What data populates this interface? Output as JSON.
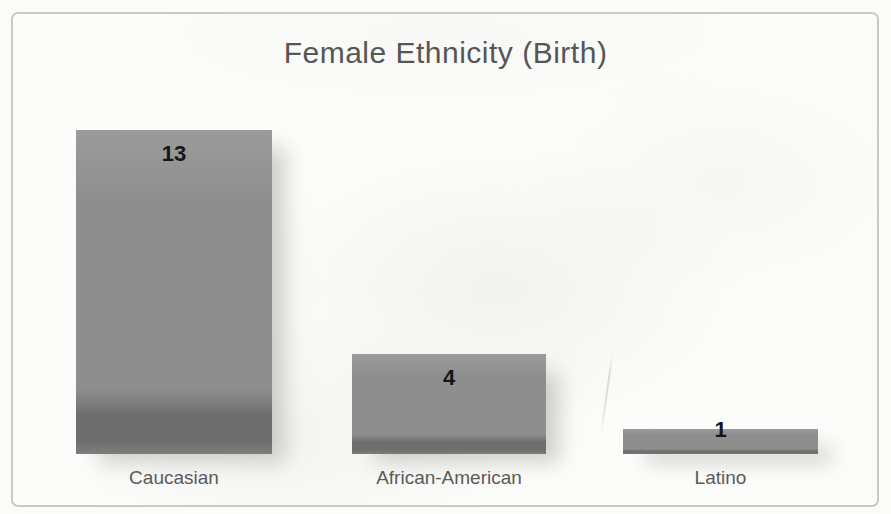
{
  "chart_data": {
    "type": "bar",
    "title": "Female Ethnicity (Birth)",
    "categories": [
      "Caucasian",
      "African-American",
      "Latino"
    ],
    "values": [
      13,
      4,
      1
    ],
    "xlabel": "",
    "ylabel": "",
    "ylim": [
      0,
      13
    ],
    "grid": false,
    "legend": "none",
    "value_labels_position": "inside-end",
    "colors": {
      "bar_fill": "#8e8e8e",
      "bar_fill_light": "#9b9b9b",
      "bar_bottom_edge": "#6e6e6e",
      "value_label": "#161616",
      "category_label": "#5a5a5a",
      "title": "#565656",
      "frame_border": "#c9c9c4",
      "background": "#fbfbf9"
    }
  }
}
